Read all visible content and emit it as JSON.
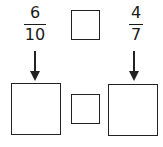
{
  "fractions": {
    "left": {
      "numerator": "6",
      "denominator": "10"
    },
    "right": {
      "numerator": "4",
      "denominator": "7"
    }
  },
  "boxes": {
    "top_compare": "",
    "bottom_left_answer": "",
    "bottom_middle_compare": "",
    "bottom_right_answer": ""
  },
  "colors": {
    "stroke": "#222222",
    "background": "#ffffff"
  }
}
